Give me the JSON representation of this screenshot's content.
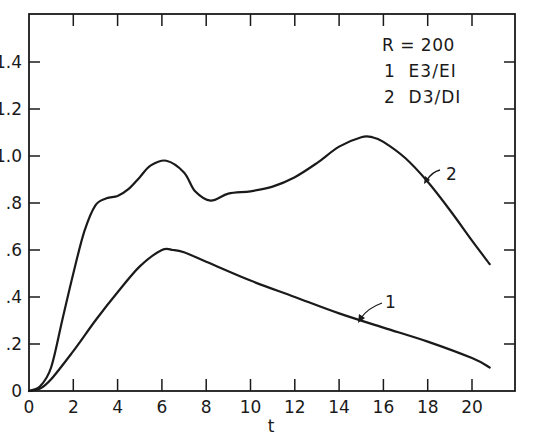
{
  "chart_data": {
    "type": "line",
    "title": "",
    "xlabel": "t",
    "ylabel": "",
    "xlim": [
      0,
      22
    ],
    "ylim": [
      0,
      1.6
    ],
    "grid": false,
    "x_ticks": [
      0,
      2,
      4,
      6,
      8,
      10,
      12,
      14,
      16,
      18,
      20
    ],
    "x_tick_labels": [
      "0",
      "2",
      "4",
      "6",
      "8",
      "10",
      "12",
      "14",
      "16",
      "18",
      "20"
    ],
    "y_ticks": [
      0,
      0.2,
      0.4,
      0.6,
      0.8,
      1.0,
      1.2,
      1.4
    ],
    "y_tick_labels": [
      "0",
      "0.2",
      "0.4",
      "0.6",
      "0.8",
      "1.0",
      "1.2",
      "1.4"
    ],
    "legend": {
      "position": "upper right (inside)",
      "header": "R = 200",
      "entries": [
        "1  E3/E1",
        "2  D3/D1"
      ]
    },
    "series": [
      {
        "name": "1",
        "label": "E3/E1",
        "annotation": "1",
        "x": [
          0,
          0.5,
          1,
          2,
          3,
          4,
          5,
          6,
          6.5,
          7,
          8,
          10,
          12,
          14,
          16,
          18,
          20,
          20.8
        ],
        "values": [
          0,
          0.01,
          0.05,
          0.17,
          0.3,
          0.42,
          0.53,
          0.6,
          0.6,
          0.59,
          0.55,
          0.47,
          0.4,
          0.33,
          0.27,
          0.21,
          0.14,
          0.1
        ]
      },
      {
        "name": "2",
        "label": "D3/D1",
        "annotation": "2",
        "x": [
          0,
          0.5,
          1,
          1.5,
          2,
          2.5,
          3,
          3.5,
          4,
          4.5,
          5,
          5.5,
          6.2,
          7,
          7.5,
          8.2,
          9,
          10,
          11,
          12,
          13,
          14,
          15,
          15.5,
          16,
          17,
          18,
          19,
          20,
          20.8
        ],
        "values": [
          0,
          0.02,
          0.1,
          0.3,
          0.5,
          0.68,
          0.79,
          0.82,
          0.83,
          0.86,
          0.91,
          0.96,
          0.98,
          0.93,
          0.85,
          0.81,
          0.84,
          0.85,
          0.87,
          0.91,
          0.97,
          1.04,
          1.08,
          1.08,
          1.06,
          0.99,
          0.89,
          0.77,
          0.64,
          0.54
        ]
      }
    ]
  },
  "display": {
    "legend_line_0": "R = 200",
    "legend_line_1": "1  E3/EI",
    "legend_line_2": "2  D3/DI",
    "x_axis_label": "t",
    "y_tick_display": [
      "0",
      ".2",
      ".4",
      ".6",
      ".8",
      "1.0",
      "1.2",
      "1.4"
    ],
    "annot_1": "1",
    "annot_2": "2"
  }
}
